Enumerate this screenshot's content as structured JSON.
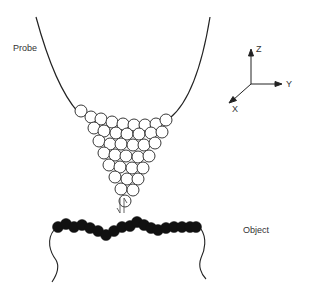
{
  "labels": {
    "probe": "Probe",
    "object": "Object",
    "axis_z": "Z",
    "axis_y": "Y",
    "axis_x": "X",
    "interaction_symbol": "⇃↾"
  },
  "colors": {
    "line": "#222222",
    "probe_sphere_fill": "#ffffff",
    "object_sphere_fill": "#111111",
    "text": "#333333"
  }
}
